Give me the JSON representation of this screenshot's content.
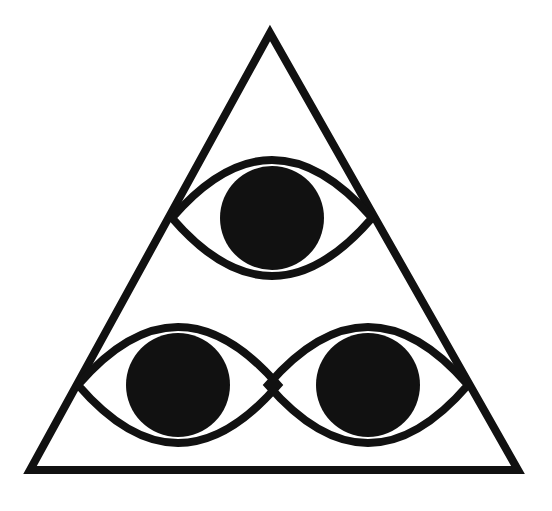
{
  "figure": {
    "stroke_color": "#111111",
    "fill_color": "#111111",
    "background": "#ffffff",
    "triangle": {
      "apex": [
        270,
        33
      ],
      "left": [
        30,
        470
      ],
      "right": [
        518,
        470
      ],
      "stroke_width": 8
    },
    "eyes": [
      {
        "name": "top-eye",
        "cx": 272,
        "cy": 218,
        "half_width": 100,
        "half_height": 58,
        "pupil_r": 52
      },
      {
        "name": "bottom-left-eye",
        "cx": 178,
        "cy": 385,
        "half_width": 100,
        "half_height": 58,
        "pupil_r": 52
      },
      {
        "name": "bottom-right-eye",
        "cx": 368,
        "cy": 385,
        "half_width": 100,
        "half_height": 58,
        "pupil_r": 52
      }
    ]
  }
}
